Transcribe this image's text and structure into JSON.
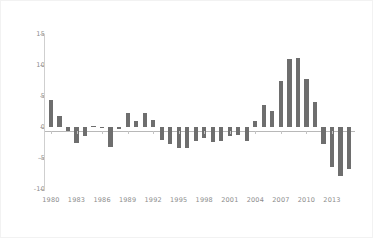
{
  "chart_data": {
    "type": "bar",
    "title": "",
    "subtitle": "",
    "xlabel": "",
    "ylabel": "",
    "legend": [],
    "grid": false,
    "legend_position": "none",
    "bar_color": "#6e6e6e",
    "axis_color": "#cfcfcf",
    "tick_label_color": "#8c8c8c",
    "background_color": "#ffffff",
    "xlim": [
      1979.3,
      2015.7
    ],
    "ylim": [
      -10,
      15
    ],
    "ytick_values": [
      15,
      10,
      5,
      0,
      -5,
      -10
    ],
    "ytick_labels": [
      "15",
      "10",
      "5",
      "0",
      "-5",
      "-10"
    ],
    "xtick_values": [
      1980,
      1983,
      1986,
      1989,
      1992,
      1995,
      1998,
      2001,
      2004,
      2007,
      2010,
      2013
    ],
    "xtick_labels": [
      "1980",
      "1983",
      "1986",
      "1989",
      "1992",
      "1995",
      "1998",
      "2001",
      "2004",
      "2007",
      "2010",
      "2013"
    ],
    "categories": [
      1980,
      1981,
      1982,
      1983,
      1984,
      1985,
      1986,
      1987,
      1988,
      1989,
      1990,
      1991,
      1992,
      1993,
      1994,
      1995,
      1996,
      1997,
      1998,
      1999,
      2000,
      2001,
      2002,
      2003,
      2004,
      2005,
      2006,
      2007,
      2008,
      2009,
      2010,
      2011,
      2012,
      2013,
      2014,
      2015
    ],
    "values": [
      4.3,
      1.8,
      -0.7,
      -2.6,
      -1.5,
      0.2,
      -0.1,
      -3.3,
      -0.3,
      2.2,
      1.0,
      2.3,
      1.2,
      -2.1,
      -2.7,
      -3.4,
      -3.4,
      -2.3,
      -1.7,
      -2.4,
      -2.3,
      -1.4,
      -1.3,
      -2.2,
      0.9,
      3.5,
      2.6,
      7.4,
      11.0,
      11.1,
      7.8,
      4.1,
      -2.7,
      -6.5,
      -7.9,
      -6.7
    ]
  }
}
